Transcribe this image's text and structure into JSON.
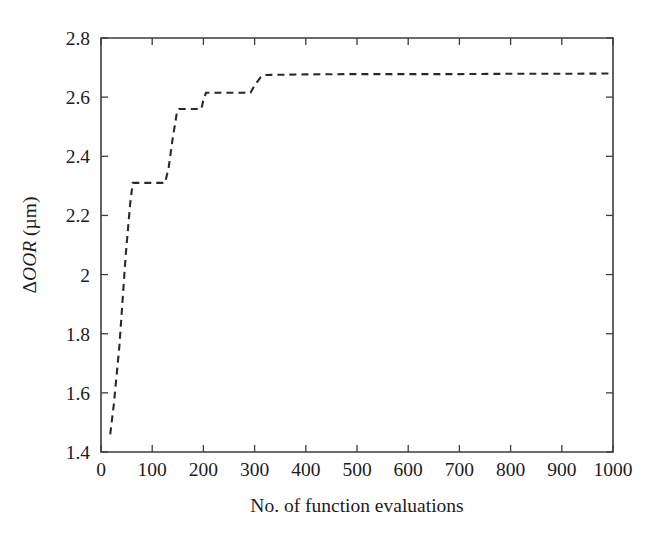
{
  "figure": {
    "name": "delta-oor-convergence-plot",
    "background_color": "#ffffff",
    "line_color": "#2a2a2a",
    "axis_color": "#3d3d3d"
  },
  "chart_data": {
    "type": "line",
    "title": "",
    "subtitle": "",
    "xlabel": "No. of function evaluations",
    "ylabel": "ΔOOR (µm)",
    "ylabel_parts": {
      "delta": "Δ",
      "italic": "OOR",
      "units": " (µm)"
    },
    "xlim": [
      0,
      1000
    ],
    "ylim": [
      1.4,
      2.8
    ],
    "xticks": [
      0,
      100,
      200,
      300,
      400,
      500,
      600,
      700,
      800,
      900,
      1000
    ],
    "xtick_labels": [
      "0",
      "100",
      "200",
      "300",
      "400",
      "500",
      "600",
      "700",
      "800",
      "900",
      "1000"
    ],
    "yticks": [
      1.4,
      1.6,
      1.8,
      2.0,
      2.2,
      2.4,
      2.6,
      2.8
    ],
    "ytick_labels": [
      "1.4",
      "1.6",
      "1.8",
      "2",
      "2.2",
      "2.4",
      "2.6",
      "2.8"
    ],
    "grid": false,
    "legend": null,
    "legend_position": "none",
    "annotations": [],
    "series": [
      {
        "name": "ΔOOR convergence",
        "style": "dashed",
        "color": "#2a2a2a",
        "x": [
          18,
          25,
          36,
          48,
          57,
          62,
          125,
          132,
          140,
          148,
          152,
          160,
          196,
          200,
          205,
          212,
          292,
          300,
          312,
          320,
          400,
          500,
          600,
          700,
          800,
          900,
          1000
        ],
        "y": [
          1.46,
          1.56,
          1.76,
          2.06,
          2.24,
          2.31,
          2.31,
          2.36,
          2.46,
          2.545,
          2.56,
          2.56,
          2.56,
          2.59,
          2.615,
          2.615,
          2.615,
          2.64,
          2.668,
          2.675,
          2.677,
          2.678,
          2.678,
          2.678,
          2.679,
          2.679,
          2.68
        ]
      }
    ]
  },
  "geometry": {
    "plot_left": 101,
    "plot_right": 613,
    "plot_top": 38,
    "plot_bottom": 452
  }
}
